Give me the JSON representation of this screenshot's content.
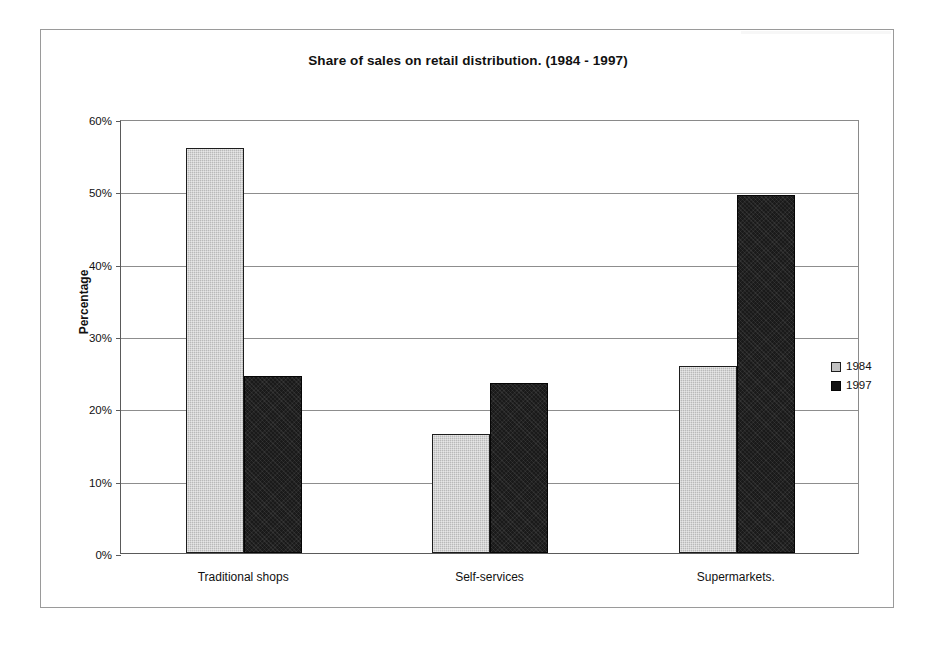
{
  "chart_data": {
    "type": "bar",
    "title": "Share of sales on retail distribution. (1984 - 1997)",
    "xlabel": "",
    "ylabel": "Percentage",
    "categories": [
      "Traditional shops",
      "Self-services",
      "Supermarkets."
    ],
    "series": [
      {
        "name": "1984",
        "color": "#b9b9b9",
        "values": [
          56.0,
          16.5,
          25.8
        ]
      },
      {
        "name": "1997",
        "color": "#1a1a1a",
        "values": [
          24.5,
          23.5,
          49.5
        ]
      }
    ],
    "ylim": [
      0,
      60
    ],
    "ytick_step": 10,
    "ytick_labels": [
      "0%",
      "10%",
      "20%",
      "30%",
      "40%",
      "50%",
      "60%"
    ],
    "ytick_values": [
      0,
      10,
      20,
      30,
      40,
      50,
      60
    ],
    "grid": "horizontal",
    "legend_position": "right",
    "legend_entries": [
      "1984",
      "1997"
    ]
  }
}
